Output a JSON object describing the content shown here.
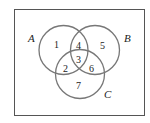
{
  "diagram": {
    "type": "venn",
    "sets": [
      {
        "name": "A",
        "label": "A"
      },
      {
        "name": "B",
        "label": "B"
      },
      {
        "name": "C",
        "label": "C"
      }
    ],
    "regions": {
      "r1": "1",
      "r2": "2",
      "r3": "3",
      "r4": "4",
      "r5": "5",
      "r6": "6",
      "r7": "7"
    },
    "colors": {
      "border": "#555555",
      "circle": "#777777",
      "text": "#222222",
      "background": "#ffffff"
    }
  }
}
